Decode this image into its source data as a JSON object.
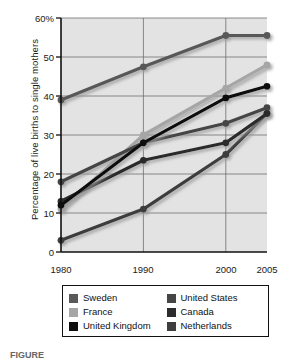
{
  "chart_data": {
    "type": "line",
    "title": "",
    "xlabel": "",
    "ylabel": "Percentage of live births to single mothers",
    "x": [
      1980,
      1990,
      2000,
      2005
    ],
    "x_tick_labels": [
      "1980",
      "1990",
      "2000",
      "2005"
    ],
    "y_tick_labels": [
      "0",
      "10",
      "20",
      "30",
      "40",
      "50",
      "60%"
    ],
    "y_ticks": [
      0,
      10,
      20,
      30,
      40,
      50,
      60
    ],
    "ylim": [
      0,
      60
    ],
    "xlim": [
      1980,
      2005
    ],
    "grid": "horizontal-and-vertical",
    "legend_position": "below-plot",
    "plot_background": "#e3e3e3",
    "series": [
      {
        "name": "Sweden",
        "color": "#595959",
        "values": [
          39,
          47.5,
          55.5,
          55.5
        ]
      },
      {
        "name": "France",
        "color": "#a6a6a6",
        "values": [
          11,
          30,
          42,
          48
        ]
      },
      {
        "name": "United Kingdom",
        "color": "#0d0d0d",
        "values": [
          12,
          28,
          39.5,
          42.5
        ]
      },
      {
        "name": "United States",
        "color": "#454545",
        "values": [
          18,
          28,
          33,
          37
        ]
      },
      {
        "name": "Canada",
        "color": "#2b2b2b",
        "values": [
          13,
          23.5,
          28,
          35.5
        ]
      },
      {
        "name": "Netherlands",
        "color": "#3d3d3d",
        "values": [
          3,
          11,
          25,
          35.5
        ]
      }
    ]
  },
  "legend": {
    "items": [
      {
        "label": "Sweden",
        "color": "#595959"
      },
      {
        "label": "United States",
        "color": "#454545"
      },
      {
        "label": "France",
        "color": "#a6a6a6"
      },
      {
        "label": "Canada",
        "color": "#2b2b2b"
      },
      {
        "label": "United Kingdom",
        "color": "#0d0d0d"
      },
      {
        "label": "Netherlands",
        "color": "#3d3d3d"
      }
    ]
  },
  "caption": {
    "text": "FIGURE"
  }
}
